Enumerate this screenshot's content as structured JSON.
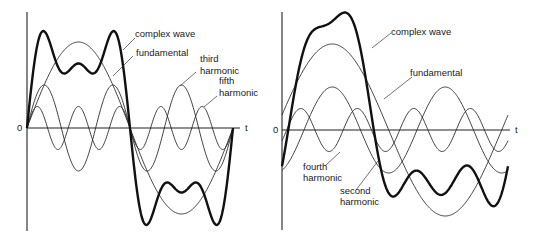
{
  "figure": {
    "panels": [
      {
        "id": "left",
        "description": "Complex wave formed from fundamental plus odd (third and fifth) harmonics",
        "origin_label": "0",
        "axis_label": "t",
        "labels": {
          "complex": "complex wave",
          "fundamental": "fundamental",
          "third_line1": "third",
          "third_line2": "harmonic",
          "fifth_line1": "fifth",
          "fifth_line2": "harmonic"
        }
      },
      {
        "id": "right",
        "description": "Complex wave formed from fundamental plus even (second and fourth) harmonics",
        "origin_label": "0",
        "axis_label": "t",
        "labels": {
          "complex": "complex wave",
          "fundamental": "fundamental",
          "fourth_line1": "fourth",
          "fourth_line2": "harmonic",
          "second_line1": "second",
          "second_line2": "harmonic"
        }
      }
    ]
  },
  "chart_data": [
    {
      "type": "line",
      "title": "Fundamental with third and fifth harmonics",
      "xlabel": "t",
      "ylabel": "",
      "grid": false,
      "x_range_cycles": [
        0,
        1
      ],
      "series": [
        {
          "name": "fundamental",
          "harmonic": 1,
          "relative_amplitude": 1.0,
          "phase_deg": 0
        },
        {
          "name": "third harmonic",
          "harmonic": 3,
          "relative_amplitude": 0.5,
          "phase_deg": 0
        },
        {
          "name": "fifth harmonic",
          "harmonic": 5,
          "relative_amplitude": 0.25,
          "phase_deg": 0
        },
        {
          "name": "complex wave",
          "harmonic": "sum",
          "style": "bold"
        }
      ]
    },
    {
      "type": "line",
      "title": "Fundamental with second and fourth harmonics",
      "xlabel": "t",
      "ylabel": "",
      "grid": false,
      "x_range_cycles": [
        0,
        1
      ],
      "series": [
        {
          "name": "fundamental",
          "harmonic": 1,
          "relative_amplitude": 1.0,
          "phase_deg": 10
        },
        {
          "name": "second harmonic",
          "harmonic": 2,
          "relative_amplitude": 0.5,
          "phase_deg": -70
        },
        {
          "name": "fourth harmonic",
          "harmonic": 4,
          "relative_amplitude": 0.25,
          "phase_deg": -30
        },
        {
          "name": "complex wave",
          "harmonic": "sum",
          "style": "bold"
        }
      ]
    }
  ],
  "geometry": {
    "left": {
      "x0": 27,
      "y0": 128,
      "width": 206,
      "amp": 86,
      "axis_top": 12,
      "axis_bottom": 231,
      "axis_right": 240
    },
    "right": {
      "x0": 282,
      "y0": 130,
      "width": 226,
      "amp": 86,
      "axis_top": 12,
      "axis_bottom": 230,
      "axis_right": 510
    }
  }
}
